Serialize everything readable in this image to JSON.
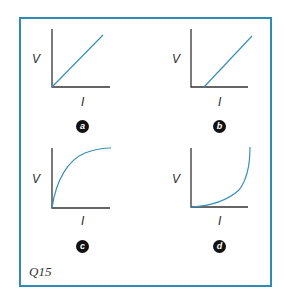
{
  "figure": {
    "question_label": "Q15",
    "frame_color": "#2f8bb3",
    "curve_color": "#3a8fb7",
    "axis_color": "#333333",
    "panels": [
      {
        "id": "a",
        "badge": "a",
        "y_label": "V",
        "x_label": "I",
        "shape": "straight line through origin"
      },
      {
        "id": "b",
        "badge": "b",
        "y_label": "V",
        "x_label": "I",
        "shape": "straight line with positive I-intercept"
      },
      {
        "id": "c",
        "badge": "c",
        "y_label": "V",
        "x_label": "I",
        "shape": "concave curve rising from origin and leveling off"
      },
      {
        "id": "d",
        "badge": "d",
        "y_label": "V",
        "x_label": "I",
        "shape": "convex curve rising steeply at high I"
      }
    ]
  }
}
